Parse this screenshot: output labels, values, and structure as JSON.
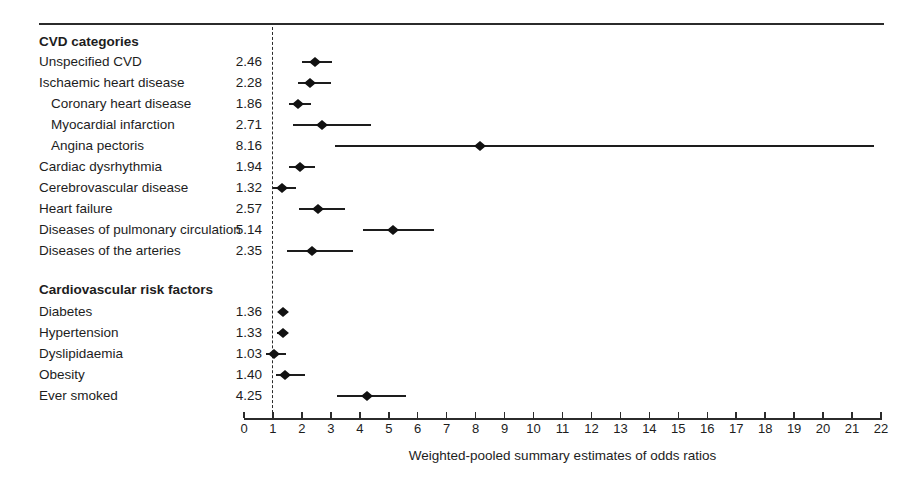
{
  "chart_data": {
    "type": "scatter",
    "subtype": "forest-plot",
    "title": "",
    "xlabel": "Weighted-pooled summary estimates of odds ratios",
    "ylabel": "",
    "xlim": [
      0,
      22
    ],
    "x_ticks": [
      0,
      1,
      2,
      3,
      4,
      5,
      6,
      7,
      8,
      9,
      10,
      11,
      12,
      13,
      14,
      15,
      16,
      17,
      18,
      19,
      20,
      21,
      22
    ],
    "reference_line_x": 1,
    "grid": false,
    "legend": false,
    "marker": "filled-diamond",
    "groups": [
      {
        "name": "CVD categories",
        "points": [
          {
            "label": "Unspecified CVD",
            "value_text": "2.46",
            "odds_ratio": 2.46,
            "ci_low": 2.0,
            "ci_high": 3.05,
            "indent": false
          },
          {
            "label": "Ischaemic heart disease",
            "value_text": "2.28",
            "odds_ratio": 2.28,
            "ci_low": 1.85,
            "ci_high": 3.0,
            "indent": false
          },
          {
            "label": "Coronary heart disease",
            "value_text": "1.86",
            "odds_ratio": 1.86,
            "ci_low": 1.55,
            "ci_high": 2.3,
            "indent": true
          },
          {
            "label": "Myocardial infarction",
            "value_text": "2.71",
            "odds_ratio": 2.71,
            "ci_low": 1.7,
            "ci_high": 4.4,
            "indent": true
          },
          {
            "label": "Angina pectoris",
            "value_text": "8.16",
            "odds_ratio": 8.16,
            "ci_low": 3.15,
            "ci_high": 21.75,
            "indent": true
          },
          {
            "label": "Cardiac dysrhythmia",
            "value_text": "1.94",
            "odds_ratio": 1.94,
            "ci_low": 1.55,
            "ci_high": 2.45,
            "indent": false
          },
          {
            "label": "Cerebrovascular disease",
            "value_text": "1.32",
            "odds_ratio": 1.32,
            "ci_low": 1.0,
            "ci_high": 1.8,
            "indent": false
          },
          {
            "label": "Heart failure",
            "value_text": "2.57",
            "odds_ratio": 2.57,
            "ci_low": 1.9,
            "ci_high": 3.5,
            "indent": false
          },
          {
            "label": "Diseases of pulmonary circulation",
            "value_text": "5.14",
            "odds_ratio": 5.14,
            "ci_low": 4.1,
            "ci_high": 6.55,
            "indent": false
          },
          {
            "label": "Diseases of the arteries",
            "value_text": "2.35",
            "odds_ratio": 2.35,
            "ci_low": 1.5,
            "ci_high": 3.75,
            "indent": false
          }
        ]
      },
      {
        "name": "Cardiovascular risk factors",
        "points": [
          {
            "label": "Diabetes",
            "value_text": "1.36",
            "odds_ratio": 1.36,
            "ci_low": 1.2,
            "ci_high": 1.5,
            "indent": false
          },
          {
            "label": "Hypertension",
            "value_text": "1.33",
            "odds_ratio": 1.33,
            "ci_low": 1.15,
            "ci_high": 1.5,
            "indent": false
          },
          {
            "label": "Dyslipidaemia",
            "value_text": "1.03",
            "odds_ratio": 1.03,
            "ci_low": 0.75,
            "ci_high": 1.45,
            "indent": false
          },
          {
            "label": "Obesity",
            "value_text": "1.40",
            "odds_ratio": 1.4,
            "ci_low": 1.1,
            "ci_high": 2.1,
            "indent": false
          },
          {
            "label": "Ever smoked",
            "value_text": "4.25",
            "odds_ratio": 4.25,
            "ci_low": 3.2,
            "ci_high": 5.6,
            "indent": false
          }
        ]
      }
    ],
    "colors": {
      "ink": "#1d1d1d",
      "line": "#2b2b2b",
      "background": "#ffffff"
    }
  }
}
